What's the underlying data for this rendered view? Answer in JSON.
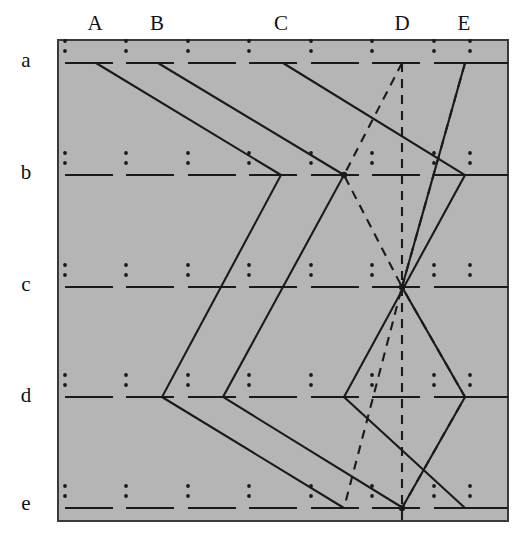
{
  "figure": {
    "type": "lattice-braid-diagram",
    "frame": {
      "x": 58,
      "y": 40,
      "width": 450,
      "height": 481,
      "fill_color": "#b5b5b5",
      "border_color": "#3a3a3a",
      "border_width": 2
    },
    "ink_color": "#1a1a1a",
    "column_labels": [
      {
        "text": "A",
        "x": 95,
        "y": 34
      },
      {
        "text": "B",
        "x": 157,
        "y": 34
      },
      {
        "text": "C",
        "x": 281,
        "y": 34
      },
      {
        "text": "D",
        "x": 402,
        "y": 34
      },
      {
        "text": "E",
        "x": 464,
        "y": 34
      }
    ],
    "row_labels": [
      {
        "text": "a",
        "x": 26,
        "y": 60
      },
      {
        "text": "b",
        "x": 26,
        "y": 172
      },
      {
        "text": "c",
        "x": 26,
        "y": 284
      },
      {
        "text": "d",
        "x": 26,
        "y": 395
      },
      {
        "text": "e",
        "x": 26,
        "y": 503
      }
    ],
    "row_y": [
      63,
      175,
      287,
      397,
      508
    ],
    "cell_x_starts": [
      65,
      126,
      188,
      249,
      311,
      372,
      434,
      470
    ],
    "segment_length": 48,
    "colon_dot_offsets": [
      -22,
      -12
    ],
    "nodes": {
      "a_cells": 8,
      "b_cells": 8,
      "c_cells": 8,
      "d_cells": 8,
      "e_cells": 8
    },
    "solid_paths": [
      {
        "name": "path-1",
        "points": [
          [
            96,
            63
          ],
          [
            281,
            175
          ],
          [
            162,
            397
          ],
          [
            344,
            508
          ]
        ]
      },
      {
        "name": "path-2",
        "points": [
          [
            158,
            63
          ],
          [
            344,
            175
          ],
          [
            223,
            397
          ],
          [
            403,
            508
          ]
        ]
      },
      {
        "name": "path-3",
        "points": [
          [
            283,
            63
          ],
          [
            465,
            175
          ],
          [
            344,
            397
          ],
          [
            465,
            508
          ]
        ]
      },
      {
        "name": "path-4",
        "points": [
          [
            465,
            63
          ],
          [
            402,
            287
          ],
          [
            465,
            397
          ],
          [
            402,
            508
          ]
        ]
      }
    ],
    "dashed_paths": [
      {
        "name": "dashed-vertical-D",
        "points": [
          [
            402,
            63
          ],
          [
            402,
            521
          ]
        ]
      },
      {
        "name": "dashed-path-1",
        "points": [
          [
            465,
            63
          ],
          [
            402,
            287
          ],
          [
            465,
            397
          ],
          [
            402,
            508
          ]
        ]
      },
      {
        "name": "dashed-path-2",
        "points": [
          [
            402,
            63
          ],
          [
            344,
            175
          ],
          [
            402,
            287
          ],
          [
            344,
            508
          ]
        ]
      }
    ],
    "intersection_nodes": [
      {
        "x": 402,
        "y": 287,
        "label": "node-c-D"
      },
      {
        "x": 402,
        "y": 508,
        "label": "node-e-D"
      },
      {
        "x": 344,
        "y": 175,
        "label": "node-b-mid"
      }
    ]
  }
}
